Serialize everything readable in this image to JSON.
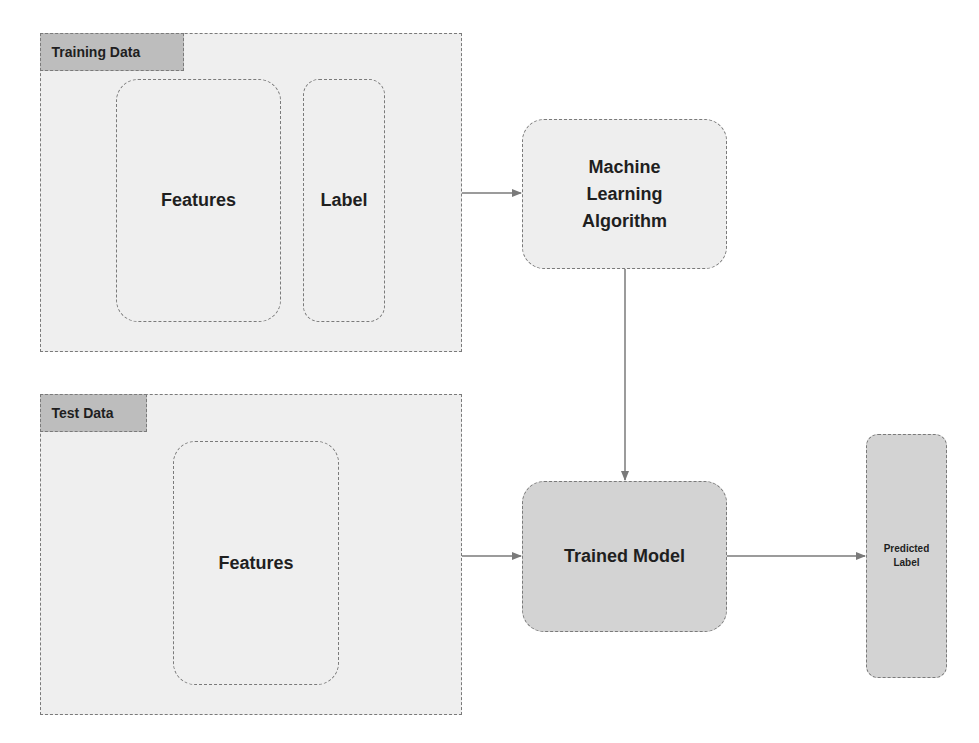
{
  "training_data": {
    "title": "Training Data",
    "features_label": "Features",
    "label_label": "Label"
  },
  "test_data": {
    "title": "Test Data",
    "features_label": "Features"
  },
  "ml_algorithm": {
    "line1": "Machine",
    "line2": "Learning",
    "line3": "Algorithm"
  },
  "trained_model": {
    "label": "Trained Model"
  },
  "predicted_label": {
    "line1": "Predicted",
    "line2": "Label"
  },
  "colors": {
    "panel_fill": "#efefef",
    "tab_fill": "#bdbdbd",
    "model_fill": "#d3d3d3",
    "border": "#7a7a7a",
    "arrow": "#7a7a7a"
  },
  "connections": [
    {
      "from": "training-data-panel",
      "to": "ml-algorithm-node"
    },
    {
      "from": "ml-algorithm-node",
      "to": "trained-model-node"
    },
    {
      "from": "test-data-panel",
      "to": "trained-model-node"
    },
    {
      "from": "trained-model-node",
      "to": "predicted-label-node"
    }
  ]
}
